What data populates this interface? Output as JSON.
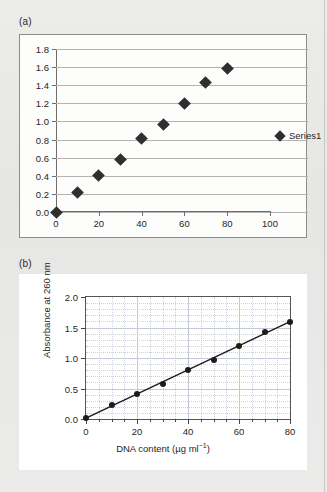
{
  "figure": {
    "panel_a_label": "(a)",
    "panel_b_label": "(b)"
  },
  "chart_data": [
    {
      "id": "panel-a",
      "type": "scatter",
      "title": "",
      "xlabel": "",
      "ylabel": "",
      "xlim": [
        0,
        100
      ],
      "ylim": [
        0,
        1.8
      ],
      "xticks": [
        0,
        20,
        40,
        60,
        80,
        100
      ],
      "yticks": [
        0.0,
        0.2,
        0.4,
        0.6,
        0.8,
        1.0,
        1.2,
        1.4,
        1.6,
        1.8
      ],
      "xtick_labels": [
        "0",
        "20",
        "40",
        "60",
        "80",
        "100"
      ],
      "ytick_labels": [
        "0.0",
        "0.2",
        "0.4",
        "0.6",
        "0.8",
        "1.0",
        "1.2",
        "1.4",
        "1.6",
        "1.8"
      ],
      "grid": "horizontal",
      "legend_position": "right",
      "marker": "diamond",
      "series": [
        {
          "name": "Series1",
          "x": [
            0,
            10,
            20,
            30,
            40,
            50,
            60,
            70,
            80
          ],
          "values": [
            0.0,
            0.21,
            0.4,
            0.58,
            0.81,
            0.97,
            1.2,
            1.43,
            1.59
          ]
        }
      ]
    },
    {
      "id": "panel-b",
      "type": "scatter",
      "title": "",
      "xlabel": "DNA content (µg ml",
      "xlabel_sup": "−1",
      "xlabel_tail": ")",
      "ylabel": "Absorbance at 260 nm",
      "xlim": [
        0,
        80
      ],
      "ylim": [
        0,
        2.0
      ],
      "xticks": [
        0,
        20,
        40,
        60,
        80
      ],
      "yticks": [
        0.0,
        0.5,
        1.0,
        1.5,
        2.0
      ],
      "xtick_labels": [
        "0",
        "20",
        "40",
        "60",
        "80"
      ],
      "ytick_labels": [
        "0.0",
        "0.5",
        "1.0",
        "1.5",
        "2.0"
      ],
      "x_minor_step": 5,
      "y_minor_step": 0.1,
      "grid": "both",
      "legend_position": "none",
      "marker": "circle",
      "fit_line": true,
      "series": [
        {
          "name": "DNA standard curve",
          "x": [
            0,
            10,
            20,
            30,
            40,
            50,
            60,
            70,
            80
          ],
          "values": [
            0.02,
            0.23,
            0.41,
            0.58,
            0.81,
            0.97,
            1.2,
            1.43,
            1.59
          ]
        }
      ]
    }
  ]
}
